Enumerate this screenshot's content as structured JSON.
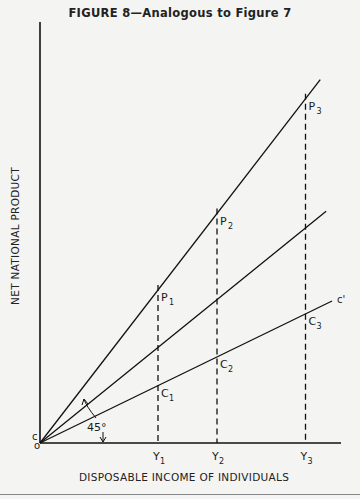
{
  "title": "FIGURE 8—Analogous to Figure 7",
  "axes": {
    "x_label": "DISPOSABLE INCOME OF INDIVIDUALS",
    "y_label": "NET NATIONAL PRODUCT",
    "origin_label": "o",
    "intercept_label": "c"
  },
  "x_ticks": [
    {
      "label": "Y",
      "sub": "1",
      "x": 4
    },
    {
      "label": "Y",
      "sub": "2",
      "x": 6
    },
    {
      "label": "Y",
      "sub": "3",
      "x": 9
    }
  ],
  "lines": [
    {
      "name": "p-line",
      "slope": 1.6,
      "x_end": 9.5,
      "label": ""
    },
    {
      "name": "45-degree-line",
      "slope": 1.0,
      "x_end": 9.7,
      "label": ""
    },
    {
      "name": "consumption-line",
      "slope": 0.6,
      "x_end": 9.9,
      "label": "c'"
    }
  ],
  "points": [
    {
      "label": "P",
      "sub": "1",
      "x": 4,
      "line": 0
    },
    {
      "label": "P",
      "sub": "2",
      "x": 6,
      "line": 0
    },
    {
      "label": "P",
      "sub": "3",
      "x": 9,
      "line": 0
    },
    {
      "label": "C",
      "sub": "1",
      "x": 4,
      "line": 2
    },
    {
      "label": "C",
      "sub": "2",
      "x": 6,
      "line": 2
    },
    {
      "label": "C",
      "sub": "3",
      "x": 9,
      "line": 2
    }
  ],
  "angle_annotation": "45°"
}
